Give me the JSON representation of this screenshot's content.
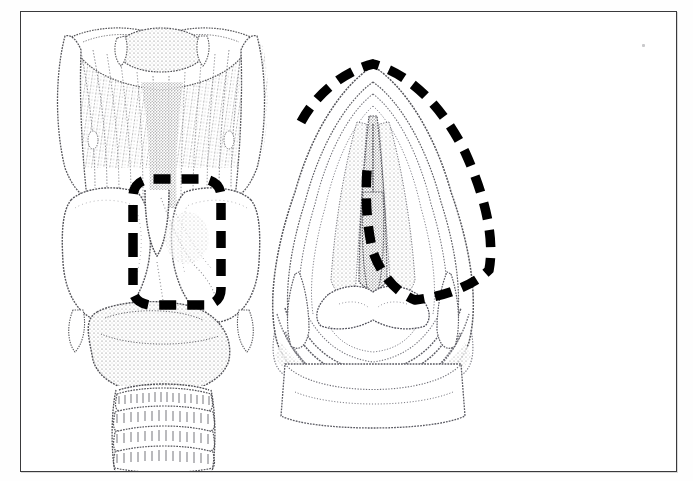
{
  "page": {
    "title": "Larynx anatomical plate",
    "background_color": "#ffffff",
    "frame_color": "#3a3a3c",
    "ink_color": "#4a4a4c",
    "marker_color": "#000000"
  },
  "plate": {
    "caption": "",
    "caption_note": "caption line cropped at bottom edge of scan; glyph tips only, illegible",
    "figures": [
      {
        "id": "figure-left",
        "name": "larynx-posterior-view",
        "label": "",
        "description": "Posterior view of the larynx with hyoid bone, thyroid cartilage laminae, cricoid cartilage and upper tracheal rings",
        "parts": [
          "hyoid-bone",
          "superior-cornu",
          "thyrohyoid-membrane",
          "thyroid-cartilage-lamina",
          "inferior-cornu",
          "cricoid-cartilage",
          "tracheal-rings"
        ],
        "marker": {
          "style": "dashed-outline",
          "shape": "rounded-rectangle",
          "color": "#000000",
          "stroke_width": 9,
          "dash": "17 11"
        }
      },
      {
        "id": "figure-right",
        "name": "laryngeal-inlet-superior-view",
        "label": "",
        "description": "Superior (endoscopic) view of the laryngeal inlet showing epiglottis, aryepiglottic folds, vocal folds and arytenoid region",
        "parts": [
          "epiglottis",
          "aryepiglottic-fold",
          "vestibular-fold",
          "vocal-fold",
          "rima-glottidis",
          "arytenoid-cartilage",
          "interarytenoid-notch",
          "piriform-recess"
        ],
        "marker": {
          "style": "dashed-outline",
          "shape": "open-arc-wedge",
          "color": "#000000",
          "stroke_width": 9,
          "dash": "17 11"
        }
      }
    ],
    "artifacts": [
      {
        "name": "scan-speck",
        "x": 621,
        "y": 32
      }
    ]
  }
}
